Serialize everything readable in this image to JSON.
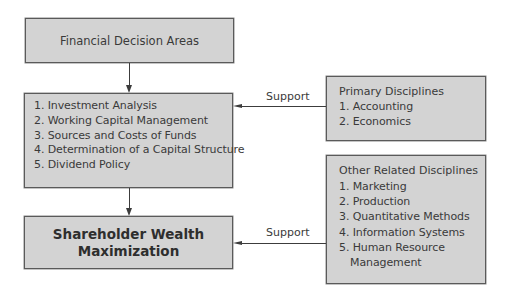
{
  "diagram": {
    "nodes": {
      "financial_decision_areas": {
        "label": "Financial Decision Areas"
      },
      "decision_areas_list": {
        "items": [
          "1. Investment Analysis",
          "2. Working Capital Management",
          "3. Sources and Costs of Funds",
          "4. Determination of a Capital Structure",
          "5. Dividend Policy"
        ]
      },
      "goal": {
        "line1": "Shareholder Wealth",
        "line2": "Maximization"
      },
      "primary_disciplines": {
        "title": "Primary Disciplines",
        "items": [
          "1. Accounting",
          "2. Economics"
        ]
      },
      "other_disciplines": {
        "title": "Other Related Disciplines",
        "items": [
          "1. Marketing",
          "2. Production",
          "3. Quantitative Methods",
          "4. Information Systems",
          "5. Human Resource"
        ],
        "item5_continuation": "Management"
      }
    },
    "edges": [
      {
        "from": "financial_decision_areas",
        "to": "decision_areas_list",
        "label": ""
      },
      {
        "from": "decision_areas_list",
        "to": "goal",
        "label": ""
      },
      {
        "from": "primary_disciplines",
        "to": "decision_areas_list",
        "label": "Support"
      },
      {
        "from": "other_disciplines",
        "to": "goal",
        "label": "Support"
      }
    ],
    "colors": {
      "box_fill": "#d3d3d3",
      "box_border": "#5a5a5a",
      "arrow": "#3c3c3c",
      "text": "#3a3a3a"
    }
  }
}
